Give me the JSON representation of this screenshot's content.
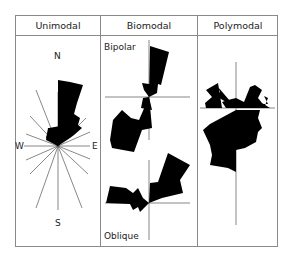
{
  "columns": [
    {
      "label": "Unimodal"
    },
    {
      "label": "Biomodal"
    },
    {
      "label": "Polymodal"
    }
  ],
  "unimodal": {
    "compass": {
      "n": "N",
      "s": "S",
      "e": "E",
      "w": "W"
    }
  },
  "biomodal": {
    "top_label": "Bipolar",
    "bottom_label": "Oblique"
  },
  "colors": {
    "fill": "#000000",
    "line": "#8a8a8a",
    "text": "#222222"
  }
}
